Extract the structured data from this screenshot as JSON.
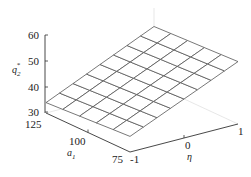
{
  "chart_data": {
    "type": "surface",
    "title": "",
    "xlabel": "η",
    "ylabel": "a₁",
    "zlabel": "q₂*",
    "x_ticks": [
      "-1",
      "0",
      "1"
    ],
    "y_ticks": [
      "75",
      "100",
      "125"
    ],
    "z_ticks": [
      "30",
      "40",
      "50",
      "60"
    ],
    "xlim": [
      -1,
      1
    ],
    "ylim": [
      75,
      125
    ],
    "zlim": [
      30,
      60
    ],
    "grid": false,
    "mesh": {
      "eta_divisions": 8,
      "a1_divisions": 5
    },
    "corners": [
      {
        "eta": -1,
        "a1": 125,
        "q2": 34
      },
      {
        "eta": -1,
        "a1": 75,
        "q2": 36
      },
      {
        "eta": 1,
        "a1": 125,
        "q2": 52.5
      },
      {
        "eta": 1,
        "a1": 75,
        "q2": 54
      }
    ],
    "colors": {
      "mesh": "#555555",
      "axis": "#333333",
      "pane_edge": "#d8d8d8"
    }
  },
  "labels": {
    "z_axis": {
      "base": "q",
      "sub": "2",
      "sup": "*"
    },
    "y_axis": {
      "base": "a",
      "sub": "1"
    },
    "x_axis": "η",
    "z_ticks": [
      "60",
      "50",
      "40",
      "30"
    ],
    "y_ticks": [
      "125",
      "100",
      "75"
    ],
    "x_ticks": [
      "-1",
      "0",
      "1"
    ]
  }
}
